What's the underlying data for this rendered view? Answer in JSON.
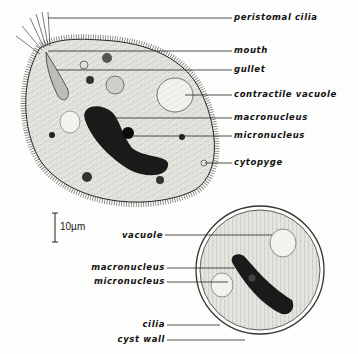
{
  "figure": {
    "scale_bar": "10µm",
    "trophozoite_labels": [
      {
        "id": "peristomal-cilia",
        "text": "peristomal cilia"
      },
      {
        "id": "mouth",
        "text": "mouth"
      },
      {
        "id": "gullet",
        "text": "gullet"
      },
      {
        "id": "contractile-vacuole",
        "text": "contractile vacuole"
      },
      {
        "id": "macronucleus",
        "text": "macronucleus"
      },
      {
        "id": "micronucleus",
        "text": "micronucleus"
      },
      {
        "id": "cytopyge",
        "text": "cytopyge"
      }
    ],
    "cyst_labels": [
      {
        "id": "vacuole",
        "text": "vacuole"
      },
      {
        "id": "macronucleus",
        "text": "macronucleus"
      },
      {
        "id": "micronucleus",
        "text": "micronucleus"
      },
      {
        "id": "cilia",
        "text": "cilia"
      },
      {
        "id": "cyst-wall",
        "text": "cyst wall"
      }
    ],
    "colors": {
      "ink": "#111111",
      "nucleus": "#1a1a1a",
      "cytoplasm": "#dcdcd6",
      "paper": "#fdfdfb"
    }
  }
}
